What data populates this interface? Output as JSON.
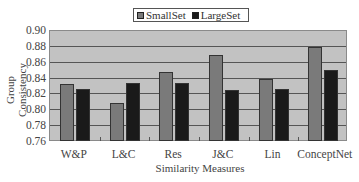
{
  "chart_data": {
    "type": "bar",
    "title": "",
    "xlabel": "Similarity Measures",
    "ylabel": "Group Consistency",
    "ylim": [
      0.76,
      0.9
    ],
    "yticks": [
      "0.90",
      "0.88",
      "0.86",
      "0.84",
      "0.82",
      "0.80",
      "0.78",
      "0.76"
    ],
    "grid": true,
    "legend_position": "top",
    "categories": [
      "W&P",
      "L&C",
      "Res",
      "J&C",
      "Lin",
      "ConceptNet"
    ],
    "series": [
      {
        "name": "SmallSet",
        "color": "#7a7a7a",
        "values": [
          0.833,
          0.809,
          0.848,
          0.87,
          0.84,
          0.88
        ]
      },
      {
        "name": "LargeSet",
        "color": "#1a1a1a",
        "values": [
          0.827,
          0.834,
          0.834,
          0.826,
          0.827,
          0.851
        ]
      }
    ]
  },
  "colors": {
    "plot_background": "#c2c2c2",
    "gridline": "#555555"
  }
}
